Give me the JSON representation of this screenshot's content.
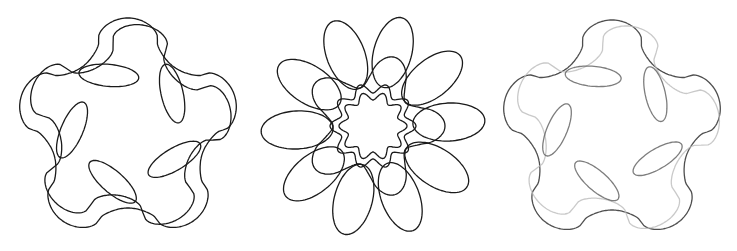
{
  "figure": {
    "background": "#ffffff",
    "panels": [
      {
        "id": "panel-1",
        "description": "five-pointed rounded star with inner elliptical loops",
        "x": 0,
        "width": 250,
        "stroke": "#1a1a1a",
        "stroke_width": 1.3,
        "curves": [
          {
            "kind": "star",
            "cx": 128,
            "cy": 130,
            "r_outer": 112,
            "r_inner": 78,
            "points": 5,
            "rotation_deg": -90,
            "bulge": 0.18,
            "color": "#1a1a1a",
            "opacity": 1
          },
          {
            "kind": "star",
            "cx": 128,
            "cy": 128,
            "r_outer": 104,
            "r_inner": 68,
            "points": 5,
            "rotation_deg": -82,
            "bulge": 0.25,
            "color": "#1a1a1a",
            "opacity": 1
          },
          {
            "kind": "loops",
            "cx": 128,
            "cy": 128,
            "ring_r": 56,
            "count": 5,
            "rx": 30,
            "ry": 11,
            "rotation_deg": -110,
            "tilt_deg": 25,
            "color": "#1a1a1a",
            "opacity": 1
          }
        ]
      },
      {
        "id": "panel-2",
        "description": "ten-petal rose with inner circular ring",
        "x": 250,
        "width": 240,
        "stroke": "#1a1a1a",
        "stroke_width": 1.3,
        "curves": [
          {
            "kind": "petals",
            "cx": 123,
            "cy": 126,
            "count": 10,
            "inner_r": 40,
            "outer_r": 112,
            "width": 19,
            "rotation_deg": -75,
            "color": "#1a1a1a",
            "opacity": 1
          },
          {
            "kind": "ring",
            "cx": 123,
            "cy": 126,
            "r": 38,
            "wobble": 5,
            "lobes": 10,
            "color": "#1a1a1a",
            "opacity": 1
          },
          {
            "kind": "ring",
            "cx": 123,
            "cy": 126,
            "r": 30,
            "wobble": 4,
            "lobes": 10,
            "color": "#1a1a1a",
            "opacity": 1
          },
          {
            "kind": "star",
            "cx": 123,
            "cy": 126,
            "r_outer": 72,
            "r_inner": 40,
            "points": 5,
            "rotation_deg": -72,
            "bulge": 0.05,
            "color": "#1a1a1a",
            "opacity": 1
          }
        ]
      },
      {
        "id": "panel-3",
        "description": "partial five-pointed star with faded gray strokes and loops",
        "x": 490,
        "width": 247,
        "stroke": "#555555",
        "stroke_width": 1.3,
        "curves": [
          {
            "kind": "star",
            "cx": 122,
            "cy": 132,
            "r_outer": 112,
            "r_inner": 78,
            "points": 5,
            "rotation_deg": -90,
            "bulge": 0.18,
            "color": "#444444",
            "opacity": 0.95
          },
          {
            "kind": "star",
            "cx": 125,
            "cy": 130,
            "r_outer": 105,
            "r_inner": 70,
            "points": 5,
            "rotation_deg": -80,
            "bulge": 0.25,
            "color": "#bbbbbb",
            "opacity": 0.8
          },
          {
            "kind": "loops",
            "cx": 122,
            "cy": 128,
            "ring_r": 55,
            "count": 5,
            "rx": 28,
            "ry": 10,
            "rotation_deg": -110,
            "tilt_deg": 25,
            "color": "#666666",
            "opacity": 0.85
          }
        ]
      }
    ]
  }
}
